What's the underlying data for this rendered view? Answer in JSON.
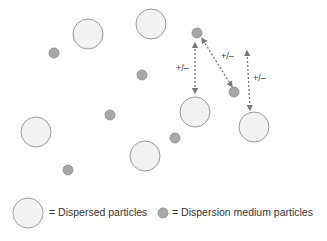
{
  "colors": {
    "large_fill": "#f2f2f2",
    "large_stroke": "#9a9a9a",
    "small_fill": "#a8a8a8",
    "small_stroke": "#8a8a8a",
    "arrow": "#777777",
    "text": "#333333"
  },
  "dispersed_particles": [
    {
      "x": 88,
      "y": 34
    },
    {
      "x": 151,
      "y": 24
    },
    {
      "x": 195,
      "y": 112
    },
    {
      "x": 254,
      "y": 127
    },
    {
      "x": 36,
      "y": 132
    },
    {
      "x": 145,
      "y": 156
    }
  ],
  "medium_particles": [
    {
      "x": 54,
      "y": 53
    },
    {
      "x": 142,
      "y": 75
    },
    {
      "x": 197,
      "y": 33
    },
    {
      "x": 234,
      "y": 92
    },
    {
      "x": 110,
      "y": 115
    },
    {
      "x": 175,
      "y": 138
    },
    {
      "x": 68,
      "y": 170
    }
  ],
  "arrows": [
    {
      "x1": 195,
      "y1": 45,
      "x2": 195,
      "y2": 91,
      "label": "+/–",
      "lx": 176,
      "ly": 71
    },
    {
      "x1": 203,
      "y1": 40,
      "x2": 231,
      "y2": 85,
      "label": "+/–",
      "lx": 221,
      "ly": 59
    },
    {
      "x1": 247,
      "y1": 53,
      "x2": 250,
      "y2": 108,
      "label": "+/–",
      "lx": 253,
      "ly": 81
    }
  ],
  "legend": {
    "dispersed_label": "= Dispersed particles",
    "medium_label": "= Dispersion medium particles"
  }
}
